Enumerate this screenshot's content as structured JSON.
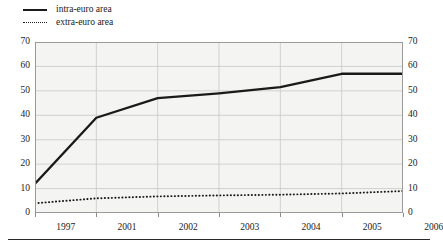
{
  "chart_data": {
    "type": "line",
    "title": "",
    "subtitle": "",
    "xlabel": "",
    "ylabel": "",
    "categories": [
      "1997",
      "2001",
      "2002",
      "2003",
      "2004",
      "2005",
      "2006"
    ],
    "ylim": [
      0,
      70
    ],
    "ytick_step": 10,
    "yticks": [
      "0",
      "10",
      "20",
      "30",
      "40",
      "50",
      "60",
      "70"
    ],
    "grid": true,
    "grid_axis": "y",
    "dual_axis": true,
    "right_axis_mirrors_left": true,
    "legend_position": "top-left",
    "series": [
      {
        "name": "intra-euro area",
        "style": "solid",
        "color": "#1a1a1a",
        "values": [
          12,
          39,
          47,
          49,
          51.5,
          57,
          57
        ]
      },
      {
        "name": "extra-euro area",
        "style": "dotted",
        "color": "#1a1a1a",
        "values": [
          4,
          6,
          6.8,
          7.2,
          7.5,
          8,
          9
        ]
      }
    ]
  },
  "legend": {
    "items": [
      {
        "label": "intra-euro area",
        "marker": "solid-line-swatch"
      },
      {
        "label": "extra-euro area",
        "marker": "dotted-line-swatch"
      }
    ]
  },
  "axes": {
    "left_ticks": [
      "70",
      "60",
      "50",
      "40",
      "30",
      "20",
      "10",
      "0"
    ],
    "right_ticks": [
      "70",
      "60",
      "50",
      "40",
      "30",
      "20",
      "10",
      "0"
    ],
    "x_ticks": [
      "1997",
      "2001",
      "2002",
      "2003",
      "2004",
      "2005",
      "2006"
    ]
  },
  "colors": {
    "plot_background": "#f4f4f2",
    "page_background": "#ffffff",
    "gridline": "#c8c8c8",
    "axis_line": "#8a8a8a",
    "series_line": "#1a1a1a",
    "text": "#1a1a1a",
    "bottom_rule": "#2b2b2b"
  }
}
